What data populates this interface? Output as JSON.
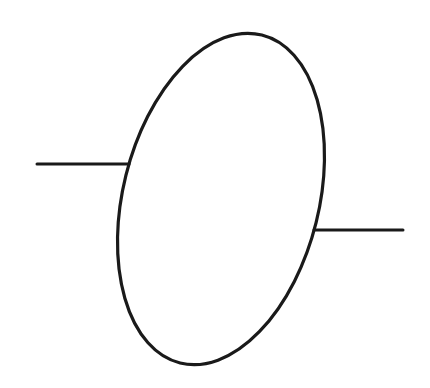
{
  "diagram": {
    "stroke_color": "#1a1a1a",
    "background": "#ffffff",
    "shapes": {
      "ellipse": {
        "cx": 221,
        "cy": 199,
        "rx": 98,
        "ry": 169,
        "rotate": 14
      },
      "left_lead": {
        "x1": 37,
        "y1": 164,
        "x2": 129,
        "y2": 164
      },
      "right_lead": {
        "x1": 314,
        "y1": 230,
        "x2": 403,
        "y2": 230
      }
    }
  }
}
